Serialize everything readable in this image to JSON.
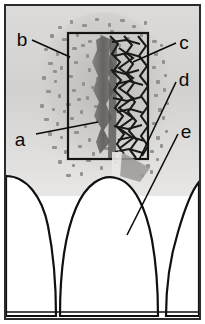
{
  "figure": {
    "width": 205,
    "height": 324,
    "border_color": "#2b2b2b",
    "background_color": "#ffffff"
  },
  "labels": [
    {
      "id": "a",
      "text": "a",
      "meaning": "graft-particle-radiopacity",
      "x": 22,
      "y": 140,
      "leader": {
        "x1": 36,
        "y1": 134,
        "x2": 98,
        "y2": 122
      }
    },
    {
      "id": "b",
      "text": "b",
      "meaning": "region-of-interest-box",
      "x": 17,
      "y": 45,
      "leader": {
        "x1": 32,
        "y1": 40,
        "x2": 70,
        "y2": 57
      }
    },
    {
      "id": "c",
      "text": "c",
      "meaning": "trabecular-bone-pattern",
      "x": 178,
      "y": 48,
      "leader": {
        "x1": 176,
        "y1": 43,
        "x2": 133,
        "y2": 62
      }
    },
    {
      "id": "d",
      "text": "d",
      "meaning": "defect-margin",
      "x": 178,
      "y": 85,
      "leader": {
        "x1": 176,
        "y1": 82,
        "x2": 139,
        "y2": 160
      }
    },
    {
      "id": "e",
      "text": "e",
      "meaning": "tooth-crown-root",
      "x": 180,
      "y": 137,
      "leader": {
        "x1": 178,
        "y1": 134,
        "x2": 127,
        "y2": 235
      }
    }
  ],
  "roi_box": {
    "name": "region-of-interest",
    "x": 68,
    "y": 33,
    "width": 80,
    "height": 126,
    "stroke": "#151515",
    "stroke_width": 2.2,
    "fill": "none"
  },
  "anatomy": {
    "bone_field": {
      "name": "alveolar-bone",
      "fill": "#d3d2d0",
      "speckle_color": "#8e8d8b"
    },
    "graft_column": {
      "name": "graft-material-column",
      "fill": "#6f6e6c"
    },
    "trabecular_mesh": {
      "name": "trabecular-mesh",
      "stroke": "#1a1a1a"
    },
    "teeth": [
      {
        "name": "tooth-left-partial",
        "fill": "#ffffff",
        "outline": "#101010"
      },
      {
        "name": "tooth-center",
        "fill": "#ffffff",
        "outline": "#101010"
      },
      {
        "name": "tooth-right-partial",
        "fill": "#ffffff",
        "outline": "#101010"
      }
    ]
  }
}
